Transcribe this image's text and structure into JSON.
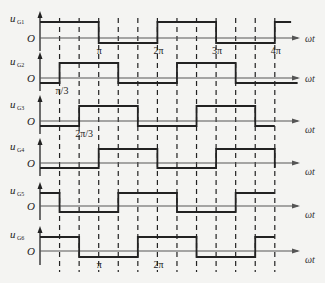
{
  "figure": {
    "origin_label": "O",
    "x_axis_label": "ωt",
    "stroke_color": "#222222",
    "background": "#f4f4f2",
    "dashed_lines_deg": [
      60,
      120,
      180,
      240,
      300,
      360,
      420,
      480,
      540,
      600,
      660,
      720
    ],
    "tick_labels": [
      {
        "row": 0,
        "text": "π",
        "deg": 180
      },
      {
        "row": 0,
        "text": "2π",
        "deg": 360
      },
      {
        "row": 0,
        "text": "3π",
        "deg": 540
      },
      {
        "row": 0,
        "text": "4π",
        "deg": 720
      },
      {
        "row": 1,
        "text": "π/3",
        "deg": 60
      },
      {
        "row": 2,
        "text": "2π/3",
        "deg": 120
      },
      {
        "row": 5,
        "text": "π",
        "deg": 180
      },
      {
        "row": 5,
        "text": "2π",
        "deg": 360
      }
    ],
    "signals": [
      {
        "name": "u",
        "sub": "G1",
        "initial": "high",
        "edges_deg": [
          180,
          360,
          540,
          720
        ],
        "end_deg": 770
      },
      {
        "name": "u",
        "sub": "G2",
        "initial": "low",
        "edges_deg": [
          60,
          240,
          420,
          600
        ],
        "end_deg": 790
      },
      {
        "name": "u",
        "sub": "G3",
        "initial": "low",
        "edges_deg": [
          120,
          300,
          480,
          660
        ],
        "end_deg": 720
      },
      {
        "name": "u",
        "sub": "G4",
        "initial": "low",
        "edges_deg": [
          180,
          360,
          540,
          720
        ],
        "end_deg": 720
      },
      {
        "name": "u",
        "sub": "G5",
        "initial": "high",
        "edges_deg": [
          60,
          240,
          420,
          600
        ],
        "end_deg": 720
      },
      {
        "name": "u",
        "sub": "G6",
        "initial": "high",
        "edges_deg": [
          120,
          300,
          480,
          660
        ],
        "end_deg": 720
      }
    ]
  }
}
